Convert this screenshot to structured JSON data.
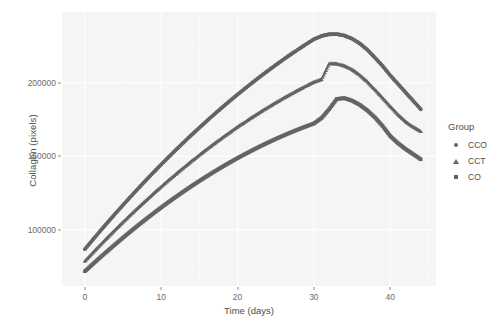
{
  "chart_data": {
    "type": "scatter",
    "title": "",
    "xlabel": "Time (days)",
    "ylabel": "Collagen (pixels)",
    "xlim": [
      -3,
      46
    ],
    "ylim": [
      62000,
      248000
    ],
    "xticks": [
      0,
      10,
      20,
      30,
      40
    ],
    "xticklabels": [
      "0",
      "10",
      "20",
      "30",
      "40"
    ],
    "yticks": [
      100000,
      150000,
      200000
    ],
    "yticklabels": [
      "100000",
      "150000",
      "200000"
    ],
    "grid": true,
    "legend_position": "right",
    "legend_title": "Group",
    "panel_color": "#f5f5f5",
    "grid_color": "#ffffff",
    "line_color": "#646464",
    "series": [
      {
        "name": "CCO",
        "marker": "circle",
        "peak_x": 29,
        "peak_y": 238000,
        "x": [
          0,
          1,
          2,
          3,
          4,
          5,
          6,
          7,
          8,
          9,
          10,
          11,
          12,
          13,
          14,
          15,
          16,
          17,
          18,
          19,
          20,
          21,
          22,
          23,
          24,
          25,
          26,
          27,
          28,
          29,
          30,
          31,
          32,
          33,
          34,
          35,
          36,
          37,
          38,
          39,
          40,
          41,
          42,
          43,
          44
        ],
        "values": [
          87000,
          93200,
          99300,
          105300,
          111200,
          117000,
          122700,
          128300,
          133800,
          139200,
          144500,
          149700,
          154800,
          159800,
          164700,
          169500,
          174200,
          178800,
          183300,
          187700,
          192000,
          196200,
          200300,
          204300,
          208200,
          212000,
          215700,
          219300,
          222800,
          226200,
          229500,
          231700,
          232900,
          233000,
          232000,
          229900,
          226700,
          222400,
          217000,
          211400,
          205000,
          199300,
          193500,
          187800,
          182000
        ]
      },
      {
        "name": "CCT",
        "marker": "triangle",
        "peak_x": 29,
        "peak_y": 215000,
        "x": [
          0,
          1,
          2,
          3,
          4,
          5,
          6,
          7,
          8,
          9,
          10,
          11,
          12,
          13,
          14,
          15,
          16,
          17,
          18,
          19,
          20,
          21,
          22,
          23,
          24,
          25,
          26,
          27,
          28,
          29,
          30,
          31,
          32,
          33,
          34,
          35,
          36,
          37,
          38,
          39,
          40,
          41,
          42,
          43,
          44
        ],
        "values": [
          79000,
          84500,
          89900,
          95200,
          100400,
          105500,
          110500,
          115400,
          120200,
          124900,
          129500,
          134000,
          138400,
          142700,
          146900,
          151000,
          155000,
          158900,
          162700,
          166400,
          170000,
          173500,
          176900,
          180200,
          183400,
          186500,
          189500,
          192400,
          195200,
          197900,
          200500,
          202300,
          213000,
          212900,
          211500,
          209000,
          205400,
          200700,
          195400,
          189800,
          184000,
          178600,
          173700,
          170100,
          167000
        ]
      },
      {
        "name": "CO",
        "marker": "square",
        "peak_x": 29,
        "peak_y": 190000,
        "x": [
          0,
          1,
          2,
          3,
          4,
          5,
          6,
          7,
          8,
          9,
          10,
          11,
          12,
          13,
          14,
          15,
          16,
          17,
          18,
          19,
          20,
          21,
          22,
          23,
          24,
          25,
          26,
          27,
          28,
          29,
          30,
          31,
          32,
          33,
          34,
          35,
          36,
          37,
          38,
          39,
          40,
          41,
          42,
          43,
          44
        ],
        "values": [
          72000,
          76700,
          81400,
          85900,
          90400,
          94800,
          99100,
          103300,
          107400,
          111400,
          115300,
          119100,
          122800,
          126400,
          129900,
          133300,
          136600,
          139800,
          142900,
          145900,
          148800,
          151600,
          154300,
          156900,
          159400,
          161800,
          164100,
          166300,
          168400,
          170400,
          172300,
          176000,
          182000,
          189000,
          189500,
          187800,
          185000,
          181200,
          176400,
          170600,
          163800,
          159000,
          155000,
          151500,
          148000
        ]
      }
    ]
  },
  "legend": {
    "title": "Group",
    "items": [
      {
        "label": "CCO",
        "marker": "circle"
      },
      {
        "label": "CCT",
        "marker": "triangle"
      },
      {
        "label": "CO",
        "marker": "square"
      }
    ]
  },
  "axes": {
    "x_title": "Time (days)",
    "y_title": "Collagen (pixels)",
    "x_ticks": [
      "0",
      "10",
      "20",
      "30",
      "40"
    ],
    "y_ticks": [
      "200000",
      "150000",
      "100000"
    ]
  }
}
